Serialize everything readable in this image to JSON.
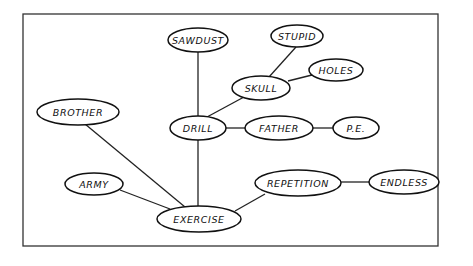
{
  "diagram": {
    "type": "concept-map",
    "nodes": [
      {
        "id": "sawdust",
        "label": "SAWDUST",
        "cx": 198,
        "cy": 40,
        "rx": 30,
        "ry": 12
      },
      {
        "id": "stupid",
        "label": "STUPID",
        "cx": 297,
        "cy": 36,
        "rx": 26,
        "ry": 11
      },
      {
        "id": "holes",
        "label": "HOLES",
        "cx": 336,
        "cy": 70,
        "rx": 27,
        "ry": 11
      },
      {
        "id": "skull",
        "label": "SKULL",
        "cx": 261,
        "cy": 88,
        "rx": 29,
        "ry": 12
      },
      {
        "id": "brother",
        "label": "BROTHER",
        "cx": 78,
        "cy": 112,
        "rx": 41,
        "ry": 13
      },
      {
        "id": "drill",
        "label": "DRILL",
        "cx": 198,
        "cy": 128,
        "rx": 28,
        "ry": 12
      },
      {
        "id": "father",
        "label": "FATHER",
        "cx": 279,
        "cy": 128,
        "rx": 34,
        "ry": 12
      },
      {
        "id": "pe",
        "label": "P.E.",
        "cx": 356,
        "cy": 128,
        "rx": 23,
        "ry": 11
      },
      {
        "id": "army",
        "label": "ARMY",
        "cx": 94,
        "cy": 184,
        "rx": 29,
        "ry": 11
      },
      {
        "id": "repetition",
        "label": "REPETITION",
        "cx": 298,
        "cy": 183,
        "rx": 43,
        "ry": 13
      },
      {
        "id": "endless",
        "label": "ENDLESS",
        "cx": 404,
        "cy": 182,
        "rx": 35,
        "ry": 12
      },
      {
        "id": "exercise",
        "label": "EXERCISE",
        "cx": 199,
        "cy": 219,
        "rx": 42,
        "ry": 13
      }
    ],
    "edges": [
      {
        "from": "sawdust",
        "to": "drill",
        "x1": 198,
        "y1": 52,
        "x2": 198,
        "y2": 116
      },
      {
        "from": "stupid",
        "to": "skull",
        "x1": 296,
        "y1": 47,
        "x2": 269,
        "y2": 77
      },
      {
        "from": "holes",
        "to": "skull",
        "x1": 312,
        "y1": 75,
        "x2": 288,
        "y2": 81
      },
      {
        "from": "skull",
        "to": "drill",
        "x1": 244,
        "y1": 97,
        "x2": 207,
        "y2": 117
      },
      {
        "from": "drill",
        "to": "father",
        "x1": 226,
        "y1": 128,
        "x2": 245,
        "y2": 128
      },
      {
        "from": "father",
        "to": "pe",
        "x1": 313,
        "y1": 128,
        "x2": 333,
        "y2": 128
      },
      {
        "from": "drill",
        "to": "exercise",
        "x1": 198,
        "y1": 140,
        "x2": 198,
        "y2": 206
      },
      {
        "from": "brother",
        "to": "exercise",
        "x1": 85,
        "y1": 124,
        "x2": 185,
        "y2": 207
      },
      {
        "from": "army",
        "to": "exercise",
        "x1": 120,
        "y1": 190,
        "x2": 170,
        "y2": 209
      },
      {
        "from": "repetition",
        "to": "exercise",
        "x1": 265,
        "y1": 194,
        "x2": 235,
        "y2": 211
      },
      {
        "from": "repetition",
        "to": "endless",
        "x1": 341,
        "y1": 182,
        "x2": 369,
        "y2": 182
      }
    ],
    "frame": {
      "x": 23,
      "y": 14,
      "width": 415,
      "height": 232
    }
  }
}
